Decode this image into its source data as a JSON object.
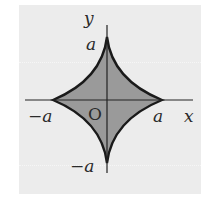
{
  "diagram": {
    "type": "astroid",
    "equation_hint": "x^(2/3) + y^(2/3) = a^(2/3)",
    "colors": {
      "background": "#ececec",
      "fill": "#9a9a9a",
      "curve": "#1a1a1a",
      "axis": "#222222",
      "text": "#2a2a2a"
    },
    "labels": {
      "y_axis": "y",
      "x_axis": "x",
      "origin": "O",
      "top": "a",
      "right": "a",
      "left": "−a",
      "bottom": "−a"
    }
  }
}
